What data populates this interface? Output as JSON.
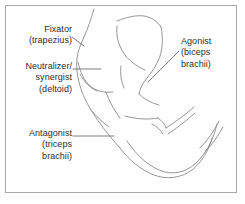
{
  "figure": {
    "background_color": "#ffffff",
    "border_color": "#a8a8a8",
    "stroke_color": "#8a8a8a",
    "leader_color": "#6e6e6e",
    "text_color": "#2e2e2e"
  },
  "labels": {
    "fixator": {
      "role": "Fixator",
      "muscle": "(trapezius)",
      "text": "Fixator\n(trapezius)",
      "align": "right"
    },
    "neutralizer": {
      "role": "Neutralizer/",
      "role_line2": "synergist",
      "muscle": "(deltoid)",
      "text": "Neutralizer/\nsynergist\n(deltoid)",
      "align": "right"
    },
    "antagonist": {
      "role": "Antagonist",
      "muscle_line1": "(triceps",
      "muscle_line2": "brachii)",
      "text": "Antagonist\n(triceps\nbrachii)",
      "align": "right"
    },
    "agonist": {
      "role": "Agonist",
      "muscle_line1": "(biceps",
      "muscle_line2": "brachii)",
      "text": "Agonist\n(biceps\nbrachii)",
      "align": "left"
    }
  }
}
